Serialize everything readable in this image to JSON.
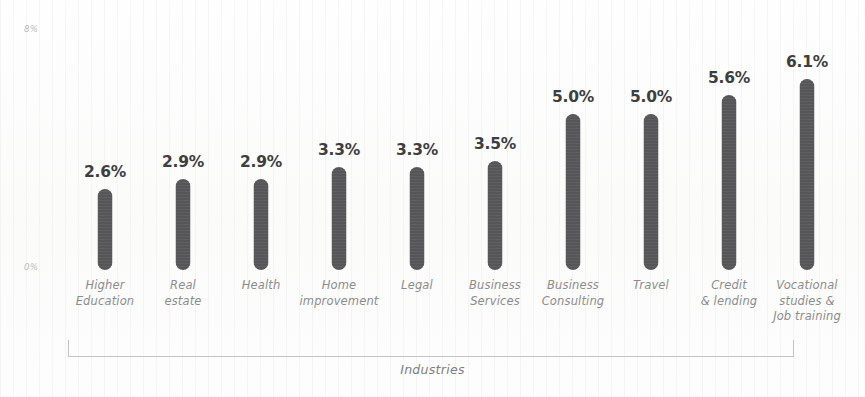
{
  "chart_data": {
    "type": "bar",
    "title": "",
    "xlabel": "Industries",
    "ylabel": "Average Conversion rate %",
    "categories": [
      "Higher\nEducation",
      "Real\nestate",
      "Health",
      "Home\nimprovement",
      "Legal",
      "Business\nServices",
      "Business\nConsulting",
      "Travel",
      "Credit\n& lending",
      "Vocational\nstudies &\nJob training"
    ],
    "values": [
      2.6,
      2.9,
      2.9,
      3.3,
      3.3,
      3.5,
      5.0,
      5.0,
      5.6,
      6.1
    ],
    "value_labels": [
      "2.6%",
      "2.9%",
      "2.9%",
      "3.3%",
      "3.3%",
      "3.5%",
      "5.0%",
      "5.0%",
      "5.6%",
      "6.1%"
    ],
    "ylim": [
      0,
      8
    ],
    "y_tick_labels": [
      "8%",
      "0%"
    ],
    "y_ticks": [
      8,
      0
    ],
    "grid": false,
    "legend": "none",
    "bar_color": "#565659",
    "label_color": "#3e3e41",
    "axis_text_color": "#8c8c8e",
    "background_color": "#fdfdfc"
  },
  "axes": {
    "y_title": "Average Conversion rate %",
    "y_tick_top": "8%",
    "y_tick_zero": "0%",
    "x_title": "Industries"
  }
}
